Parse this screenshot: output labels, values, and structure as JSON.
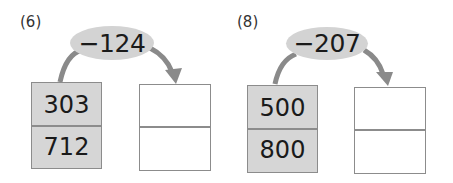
{
  "problems": [
    {
      "label": "(6)",
      "operation": "−124",
      "inputs": [
        "303",
        "712"
      ],
      "answers": [
        "",
        ""
      ]
    },
    {
      "label": "(8)",
      "operation": "−207",
      "inputs": [
        "500",
        "800"
      ],
      "answers": [
        "",
        ""
      ]
    }
  ],
  "colors": {
    "oval_fill": "#d3d3d3",
    "given_box_fill": "#d6d6d6",
    "arrow": "#8a8a8a",
    "border": "#8c8c8c"
  }
}
